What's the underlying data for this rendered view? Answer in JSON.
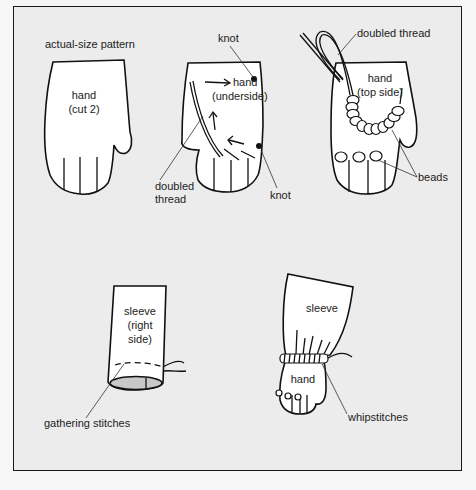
{
  "figure": {
    "panels": [
      {
        "id": "pattern",
        "title": "actual-size pattern",
        "shape_label_line1": "hand",
        "shape_label_line2": "(cut 2)"
      },
      {
        "id": "underside",
        "shape_label_line1": "hand",
        "shape_label_line2": "(underside)",
        "callouts": [
          "knot",
          "doubled",
          "thread",
          "knot"
        ]
      },
      {
        "id": "top-side",
        "shape_label_line1": "hand",
        "shape_label_line2": "(top side)",
        "callouts": [
          "doubled thread",
          "beads"
        ]
      },
      {
        "id": "sleeve-gathering",
        "shape_label_line1": "sleeve",
        "shape_label_line2": "(right",
        "shape_label_line3": "side)",
        "callouts": [
          "gathering stitches"
        ]
      },
      {
        "id": "sleeve-attach",
        "sleeve_label": "sleeve",
        "hand_label": "hand",
        "callouts": [
          "whipstitches"
        ]
      }
    ]
  },
  "colors": {
    "background": "#ececec",
    "line": "#111111",
    "fill": "#ffffff",
    "cuff_fill": "#c8c8c8"
  }
}
